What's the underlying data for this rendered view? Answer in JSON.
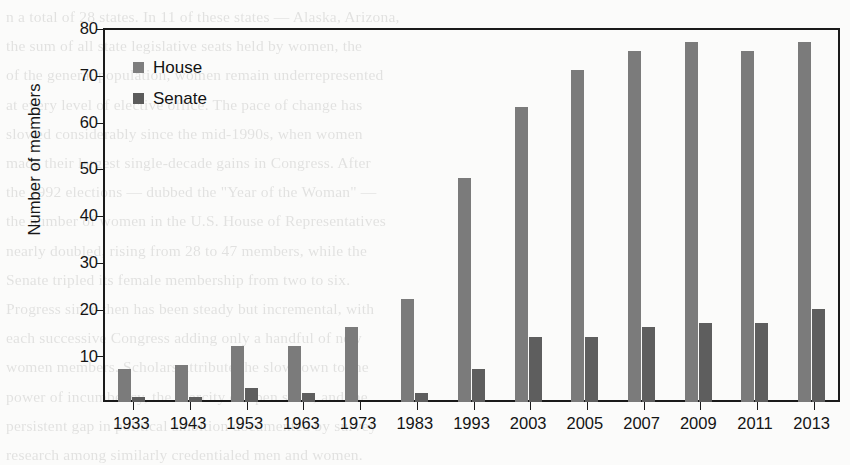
{
  "chart_data": {
    "type": "bar",
    "title": "",
    "xlabel": "",
    "ylabel": "Number of members",
    "categories": [
      "1933",
      "1943",
      "1953",
      "1963",
      "1973",
      "1983",
      "1993",
      "2003",
      "2005",
      "2007",
      "2009",
      "2011",
      "2013"
    ],
    "series": [
      {
        "name": "House",
        "color": "#7b7b7b",
        "values": [
          7,
          8,
          12,
          12,
          16,
          22,
          48,
          63,
          71,
          75,
          77,
          75,
          77
        ]
      },
      {
        "name": "Senate",
        "color": "#5e5e5e",
        "values": [
          1,
          1,
          3,
          2,
          0,
          2,
          7,
          14,
          14,
          16,
          17,
          17,
          20
        ]
      }
    ],
    "ylim": [
      0,
      80
    ],
    "yticks": [
      10,
      20,
      30,
      40,
      50,
      60,
      70,
      80
    ],
    "ytick_labels": [
      "10",
      "20",
      "30",
      "40",
      "50",
      "60",
      "70",
      "80"
    ],
    "grid": false,
    "legend_position": "top-left"
  },
  "legend": {
    "items": [
      {
        "label": "House"
      },
      {
        "label": "Senate"
      }
    ]
  },
  "background_text": "n a total of 28 states. In 11 of these states — Alaska, Arizona,\nthe sum of all state legislative seats held by women, the\nof the general population, women remain underrepresented\nat every level of elective office. The pace of change has\nslowed considerably since the mid-1990s, when women\nmade their largest single-decade gains in Congress. After\nthe 1992 elections — dubbed the \"Year of the Woman\" —\nthe number of women in the U.S. House of Representatives\nnearly doubled, rising from 28 to 47 members, while the\nSenate tripled its female membership from two to six.\nProgress since then has been steady but incremental, with\neach successive Congress adding only a handful of new\nwomen members. Scholars attribute the slowdown to the\npower of incumbency, the scarcity of open seats, and the\npersistent gap in political ambition documented by survey\nresearch among similarly credentialed men and women.\nParty differences are also pronounced: a large majority of\nthe women serving in the 113th Congress were Democrats,\nand the partisan imbalance has widened over time."
}
